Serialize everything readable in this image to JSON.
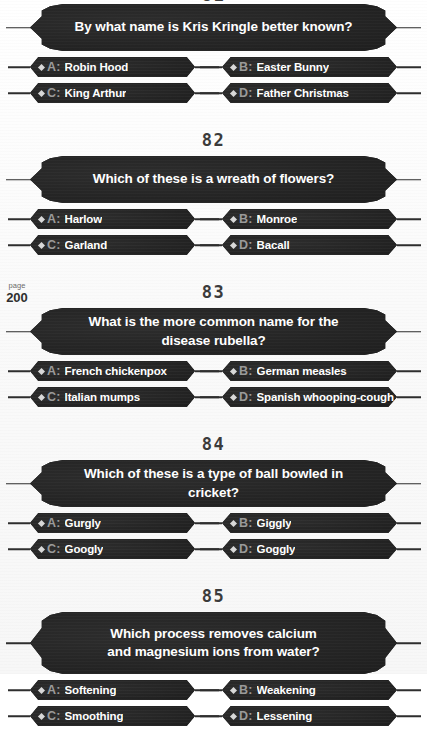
{
  "page_marker": {
    "label": "page",
    "number": "200"
  },
  "questions": [
    {
      "number": "81",
      "number_clipped": true,
      "question": "By what name is Kris Kringle better known?",
      "two_line": false,
      "answers": [
        {
          "letter": "A:",
          "text": "Robin Hood"
        },
        {
          "letter": "B:",
          "text": "Easter Bunny"
        },
        {
          "letter": "C:",
          "text": "King Arthur"
        },
        {
          "letter": "D:",
          "text": "Father Christmas"
        }
      ]
    },
    {
      "number": "82",
      "number_clipped": false,
      "question": "Which of these is a wreath of flowers?",
      "two_line": false,
      "answers": [
        {
          "letter": "A:",
          "text": "Harlow"
        },
        {
          "letter": "B:",
          "text": "Monroe"
        },
        {
          "letter": "C:",
          "text": "Garland"
        },
        {
          "letter": "D:",
          "text": "Bacall"
        }
      ]
    },
    {
      "number": "83",
      "number_clipped": false,
      "question": "What is the more common name for the disease rubella?",
      "two_line": false,
      "answers": [
        {
          "letter": "A:",
          "text": "French chickenpox"
        },
        {
          "letter": "B:",
          "text": "German measles"
        },
        {
          "letter": "C:",
          "text": "Italian mumps"
        },
        {
          "letter": "D:",
          "text": "Spanish whooping-cough"
        }
      ]
    },
    {
      "number": "84",
      "number_clipped": false,
      "question": "Which of these is a type of ball bowled in cricket?",
      "two_line": false,
      "answers": [
        {
          "letter": "A:",
          "text": "Gurgly"
        },
        {
          "letter": "B:",
          "text": "Giggly"
        },
        {
          "letter": "C:",
          "text": "Googly"
        },
        {
          "letter": "D:",
          "text": "Goggly"
        }
      ]
    },
    {
      "number": "85",
      "number_clipped": false,
      "question": "Which process removes calcium\nand magnesium ions from water?",
      "two_line": true,
      "answers": [
        {
          "letter": "A:",
          "text": "Softening"
        },
        {
          "letter": "B:",
          "text": "Weakening"
        },
        {
          "letter": "C:",
          "text": "Smoothing"
        },
        {
          "letter": "D:",
          "text": "Lessening"
        }
      ]
    }
  ],
  "colors": {
    "bar_fill": "#232323",
    "bar_text": "#ffffff",
    "letter_label": "#9a9a9a",
    "number_text": "#3b3b3b",
    "paper": "#fbfbfb"
  }
}
